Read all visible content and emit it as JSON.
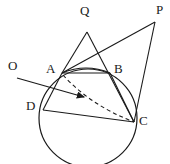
{
  "figure": {
    "type": "geometry-diagram",
    "background_color": "#ffffff",
    "stroke_color": "#1a1a1a",
    "label_color": "#1a1a1a"
  },
  "labels": {
    "Q": "Q",
    "P": "P",
    "O": "O",
    "A": "A",
    "B": "B",
    "D": "D",
    "C": "C"
  },
  "points": {
    "Q": {
      "label": "Q",
      "x": 87,
      "y": 32,
      "label_x": 80,
      "label_y": 4
    },
    "P": {
      "label": "P",
      "x": 155,
      "y": 22,
      "label_x": 156,
      "label_y": 3
    },
    "O": {
      "label": "O",
      "x": 17,
      "y": 78,
      "label_x": 8,
      "label_y": 59
    },
    "A": {
      "label": "A",
      "x": 62,
      "y": 73,
      "label_x": 46,
      "label_y": 62
    },
    "B": {
      "label": "B",
      "x": 110,
      "y": 73,
      "label_x": 114,
      "label_y": 62
    },
    "D": {
      "label": "D",
      "x": 43,
      "y": 110,
      "label_x": 26,
      "label_y": 99
    },
    "C": {
      "label": "C",
      "x": 134,
      "y": 122,
      "label_x": 139,
      "label_y": 114
    },
    "M": {
      "label": "",
      "x": 87,
      "y": 99,
      "label_x": 0,
      "label_y": 0
    }
  },
  "circle": {
    "center_x": 88,
    "center_y": 118,
    "radius": 49
  },
  "segments": [
    {
      "name": "Q-A",
      "from": "Q",
      "to": "A",
      "style": "solid"
    },
    {
      "name": "Q-C",
      "from": "Q",
      "to": "C",
      "style": "solid"
    },
    {
      "name": "P-A",
      "from": "P",
      "to": "A",
      "style": "solid"
    },
    {
      "name": "P-C",
      "from": "P",
      "to": "C",
      "style": "solid"
    },
    {
      "name": "A-B",
      "from": "A",
      "to": "B",
      "style": "solid"
    },
    {
      "name": "B-C",
      "from": "B",
      "to": "C",
      "style": "solid"
    },
    {
      "name": "A-D",
      "from": "A",
      "to": "D",
      "style": "solid"
    },
    {
      "name": "D-C",
      "from": "D",
      "to": "C",
      "style": "solid"
    },
    {
      "name": "A-C-dashed",
      "from": "A",
      "to": "C",
      "style": "dashed"
    },
    {
      "name": "O-arrow",
      "from": "O",
      "to": "M",
      "style": "solid-arrow"
    }
  ],
  "arcs": [
    {
      "name": "arc-A-B",
      "from": "A",
      "to": "B",
      "style": "solid"
    }
  ]
}
